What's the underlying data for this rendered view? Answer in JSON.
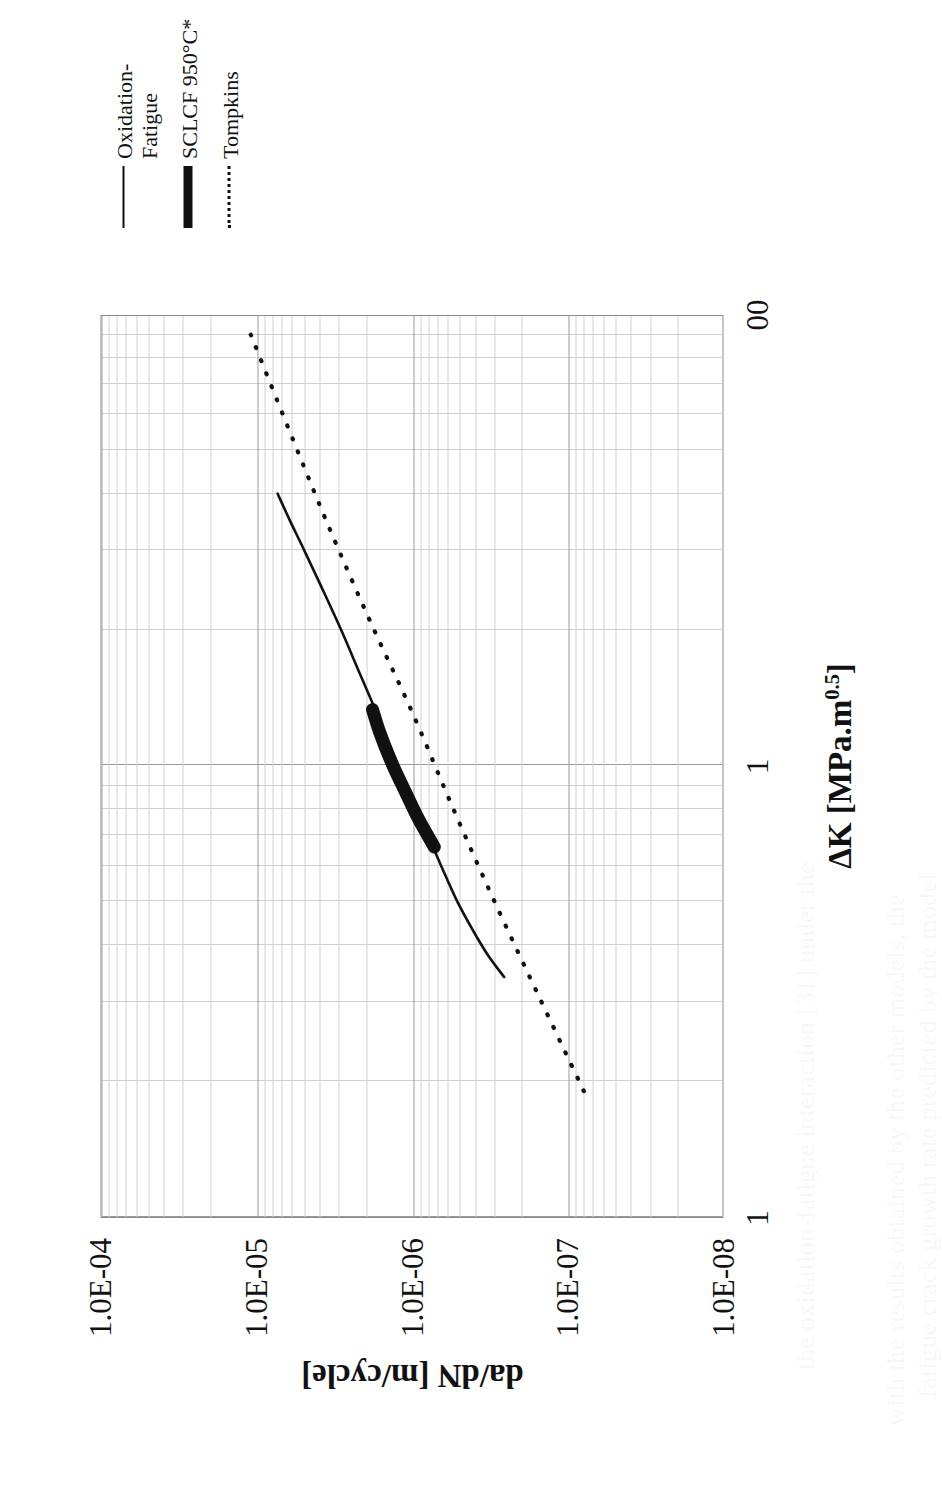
{
  "chart_data": {
    "type": "line",
    "title": "",
    "xlabel": "ΔK [MPa.m 0.5]",
    "ylabel": "da/dN [m/cycle]",
    "xscale": "log",
    "yscale": "log",
    "xlim": [
      1,
      100
    ],
    "ylim": [
      1e-08,
      0.0001
    ],
    "grid": true,
    "legend_position": "right",
    "xticks": [
      "1",
      "1",
      "00"
    ],
    "xtick_values": [
      1,
      10,
      100
    ],
    "yticks": [
      "1.0E-04",
      "1.0E-05",
      "1.0E-06",
      "1.0E-07",
      "1.0E-08"
    ],
    "ytick_values": [
      0.0001,
      1e-05,
      1e-06,
      1e-07,
      1e-08
    ],
    "series": [
      {
        "name": "Oxidation-Fatigue",
        "style": "solid-thin",
        "x": [
          3.4,
          3.8,
          4.3,
          5.0,
          6.0,
          7.2,
          8.6,
          10.5,
          13.0,
          16.0,
          20.0,
          25.0,
          30.0,
          35.0,
          40.0
        ],
        "y": [
          2.6e-07,
          3.3e-07,
          4.1e-07,
          5.2e-07,
          6.6e-07,
          8.3e-07,
          1.04e-06,
          1.32e-06,
          1.7e-06,
          2.2e-06,
          2.9e-06,
          3.9e-06,
          5e-06,
          6.2e-06,
          7.4e-06
        ]
      },
      {
        "name": "SCLCF 950°C*",
        "style": "solid-thick",
        "x": [
          6.6,
          7.6,
          8.8,
          10.2,
          11.8,
          13.3
        ],
        "y": [
          7.3e-07,
          9.2e-07,
          1.13e-06,
          1.38e-06,
          1.63e-06,
          1.82e-06
        ]
      },
      {
        "name": "Tompkins",
        "style": "dotted",
        "x": [
          1.9,
          3.0,
          5.0,
          8.0,
          13.0,
          21.0,
          34.0,
          55.0,
          90.0
        ],
        "y": [
          8e-08,
          1.5e-07,
          3e-07,
          5.5e-07,
          1e-06,
          1.9e-06,
          3.5e-06,
          6.2e-06,
          1.1e-05
        ]
      }
    ]
  },
  "axes": {
    "x_title_main": "ΔK [MPa.m",
    "x_title_sup": "0.5",
    "x_title_tail": "]",
    "y_title": "da/dN [m/cycle]"
  },
  "legend": {
    "items": [
      {
        "label": "Oxidation-\nFatigue",
        "key": "line-thin-icon"
      },
      {
        "label": "SCLCF 950°C*",
        "key": "line-thick-icon"
      },
      {
        "label": "Tompkins",
        "key": "line-dotted-icon"
      }
    ]
  },
  "colors": {
    "ink": "#111111",
    "grid_minor": "#cfcfcf",
    "grid_major": "#9a9a9a",
    "frame": "#8a8a8a",
    "background": "#ffffff"
  },
  "page_bleed": {
    "lines": [
      "with the results obtained by the other models, the",
      "fatigue crack growth rate predicted by the model",
      "the oxidation-fatigue interaction [31] under the"
    ]
  }
}
